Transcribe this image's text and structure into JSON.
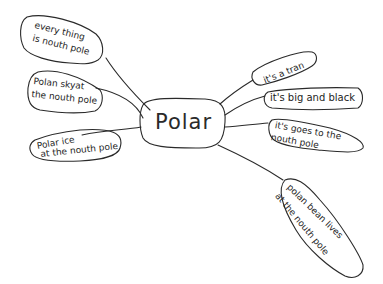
{
  "mindmap": {
    "center": {
      "label": "Polar"
    },
    "left_nodes": [
      {
        "line1": "every thing",
        "line2": "is nouth pole"
      },
      {
        "line1": "Polan skyat",
        "line2": "the nouth pole"
      },
      {
        "line1": "Polar ice",
        "line2": "at the nouth pole"
      }
    ],
    "right_nodes": [
      {
        "line1": "it's a tran"
      },
      {
        "line1": "it's big and black"
      },
      {
        "line1": "it's goes to the",
        "line2": "nouth pole"
      },
      {
        "line1": "polan bean lives",
        "line2": "at the nouth pole"
      }
    ],
    "colors": {
      "ink": "#2a2a2a",
      "background": "#ffffff"
    }
  }
}
